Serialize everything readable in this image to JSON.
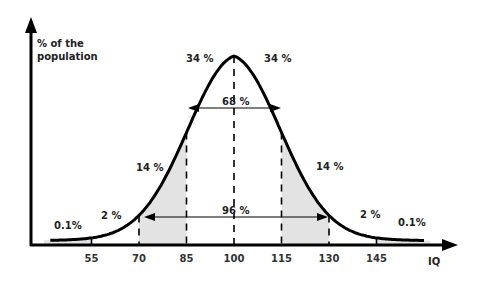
{
  "diagram": {
    "y_axis_label_line1": "% of the",
    "y_axis_label_line2": "population",
    "x_axis_label": "IQ",
    "ticks": [
      "55",
      "70",
      "85",
      "100",
      "115",
      "130",
      "145"
    ],
    "region_labels": {
      "left_tail": "0.1%",
      "left_2": "2 %",
      "left_14": "14 %",
      "left_34": "34 %",
      "right_34": "34 %",
      "right_14": "14 %",
      "right_2": "2 %",
      "right_tail": "0.1%"
    },
    "range_68_label": "68 %",
    "range_96_label": "96 %",
    "colors": {
      "curve": "#000000",
      "shade": "#e3e3e3",
      "text": "#222222"
    }
  },
  "chart_data": {
    "type": "area",
    "title": "",
    "xlabel": "IQ",
    "ylabel": "% of the population",
    "x_ticks": [
      55,
      70,
      85,
      100,
      115,
      130,
      145
    ],
    "mean": 100,
    "sd": 15,
    "segments": [
      {
        "range": [
          null,
          55
        ],
        "percent": 0.1,
        "shaded": true
      },
      {
        "range": [
          55,
          70
        ],
        "percent": 2,
        "shaded": false
      },
      {
        "range": [
          70,
          85
        ],
        "percent": 14,
        "shaded": true
      },
      {
        "range": [
          85,
          100
        ],
        "percent": 34,
        "shaded": false
      },
      {
        "range": [
          100,
          115
        ],
        "percent": 34,
        "shaded": false
      },
      {
        "range": [
          115,
          130
        ],
        "percent": 14,
        "shaded": true
      },
      {
        "range": [
          130,
          145
        ],
        "percent": 2,
        "shaded": false
      },
      {
        "range": [
          145,
          null
        ],
        "percent": 0.1,
        "shaded": true
      }
    ],
    "intervals": [
      {
        "range": [
          85,
          115
        ],
        "label": "68 %"
      },
      {
        "range": [
          70,
          130
        ],
        "label": "96 %"
      }
    ]
  }
}
